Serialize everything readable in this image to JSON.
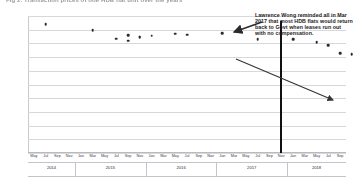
{
  "figure": {
    "title": "Fig 2. Transaction prices of one HDB flat unit over the years",
    "annotation": "Lawrence Wong reminded all in Mar 2017 that most HDB flats would return back to Govt when leases run out with no compensation.",
    "event_marker_label": "Mar 2017"
  },
  "chart_data": {
    "type": "scatter",
    "title": "Fig 2. Transaction prices of one HDB flat unit over the years",
    "xlabel": "",
    "ylabel": "",
    "grid": true,
    "legend": "none",
    "ylim": [
      160000,
      260000
    ],
    "ytick_labels": [
      "260,000",
      "250,000",
      "240,000",
      "230,000",
      "220,000",
      "210,000",
      "200,000",
      "190,000",
      "180,000",
      "170,000",
      "160,000"
    ],
    "ytick_values": [
      260000,
      250000,
      240000,
      230000,
      220000,
      210000,
      200000,
      190000,
      180000,
      170000,
      160000
    ],
    "x_months": [
      "May",
      "Jul",
      "Sep",
      "Nov",
      "Jan",
      "Mar",
      "May",
      "Jul",
      "Sep",
      "Nov",
      "Jan",
      "Mar",
      "May",
      "Jul",
      "Sep",
      "Nov",
      "Jan",
      "Mar",
      "May",
      "Jul",
      "Sep",
      "Nov",
      "Jan",
      "Mar",
      "May",
      "Jul",
      "Sep"
    ],
    "x_years": [
      "2014",
      "2015",
      "2016",
      "2017",
      "2018"
    ],
    "year_group_sizes": [
      4,
      6,
      6,
      6,
      5
    ],
    "points": [
      {
        "label": "Jul 2014",
        "x_index": 1,
        "value": 254000
      },
      {
        "label": "Sep 2015",
        "x_index": 8,
        "value": 246000
      },
      {
        "label": "Nov 2015",
        "x_index": 9,
        "value": 245000
      },
      {
        "label": "Mar 2015",
        "x_index": 5,
        "value": 249500
      },
      {
        "label": "Jul 2015",
        "x_index": 7,
        "value": 243500
      },
      {
        "label": "Sep 2015b",
        "x_index": 8,
        "value": 242000
      },
      {
        "label": "Nov 2015b",
        "x_index": 9,
        "value": 244500
      },
      {
        "label": "Jan 2016",
        "x_index": 10,
        "value": 245500
      },
      {
        "label": "Mar 2016",
        "x_index": 12,
        "value": 247000
      },
      {
        "label": "May 2016",
        "x_index": 13,
        "value": 246500
      },
      {
        "label": "Sep 2016",
        "x_index": 16,
        "value": 247500
      },
      {
        "label": "Jan 2017",
        "x_index": 19,
        "value": 243000
      },
      {
        "label": "Jul 2017",
        "x_index": 22,
        "value": 243000
      },
      {
        "label": "Mar 2018",
        "x_index": 24,
        "value": 241000
      },
      {
        "label": "May 2018",
        "x_index": 25,
        "value": 238500
      },
      {
        "label": "Jul 2018",
        "x_index": 26,
        "value": 233000
      },
      {
        "label": "Sep 2018",
        "x_index": 27,
        "value": 232000
      }
    ],
    "event_line": {
      "label": "Mar 2017",
      "x_index": 21
    },
    "trend_arrow": {
      "from": "May 2017",
      "to": "Sep 2018",
      "direction": "down"
    },
    "annotation_text": "Lawrence Wong reminded all in Mar 2017 that most HDB flats would return back to Govt when leases run out with no compensation."
  },
  "colors": {
    "point": "#2b2b2b",
    "grid": "#d8d8dc",
    "event_line": "#111111",
    "arrow": "#333333",
    "text": "#1a1a1a"
  }
}
